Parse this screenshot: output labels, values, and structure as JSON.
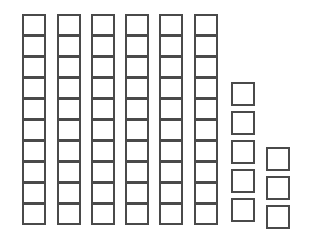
{
  "figure": {
    "background_color": "#ffffff",
    "tile_fill_color": "#ffffff",
    "tile_border_color": "#4a4a4a",
    "tile_border_width_px": 2,
    "total_tiles": 68,
    "column_count": 8
  },
  "chart_data": {
    "type": "bar",
    "subtitle": "",
    "xlabel": "",
    "ylabel": "",
    "grid": false,
    "legend": "none",
    "orientation": "vertical",
    "unit": "square tile",
    "categories": [
      "1",
      "2",
      "3",
      "4",
      "5",
      "6",
      "7",
      "8"
    ],
    "values": [
      10,
      10,
      10,
      10,
      10,
      10,
      5,
      3
    ],
    "ylim": [
      0,
      10
    ],
    "annotations": []
  },
  "columns": [
    {
      "name": "column-1",
      "count": 10,
      "style": "dense",
      "left_px": 22,
      "top_px": 14
    },
    {
      "name": "column-2",
      "count": 10,
      "style": "dense",
      "left_px": 57,
      "top_px": 14
    },
    {
      "name": "column-3",
      "count": 10,
      "style": "dense",
      "left_px": 91,
      "top_px": 14
    },
    {
      "name": "column-4",
      "count": 10,
      "style": "dense",
      "left_px": 125,
      "top_px": 14
    },
    {
      "name": "column-5",
      "count": 10,
      "style": "dense",
      "left_px": 159,
      "top_px": 14
    },
    {
      "name": "column-6",
      "count": 10,
      "style": "dense",
      "left_px": 194,
      "top_px": 14
    },
    {
      "name": "column-7",
      "count": 5,
      "style": "spaced",
      "left_px": 231,
      "top_px": 82
    },
    {
      "name": "column-8",
      "count": 3,
      "style": "spaced",
      "left_px": 266,
      "top_px": 147
    }
  ]
}
